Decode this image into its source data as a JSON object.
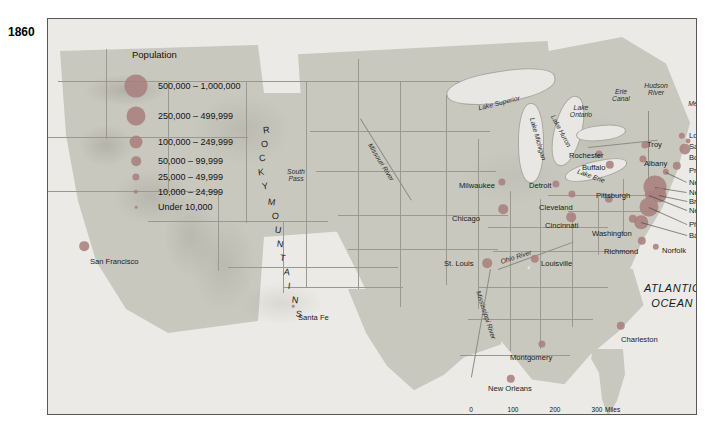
{
  "map": {
    "year": "1860",
    "ocean_label": "ATLANTIC\nOCEAN",
    "ocean_label_line1": "ATLANTIC",
    "ocean_label_line2": "OCEAN",
    "mountains_label": "ROCKY MOUNTAINS",
    "dot_color": "#a87f7e",
    "land_color": "#c9c8bf",
    "water_color": "#ebeae6",
    "border_color": "#9a988f"
  },
  "legend": {
    "title": "Population",
    "classes": [
      {
        "label": "500,000 – 1,000,000",
        "radius": 11.5
      },
      {
        "label": "250,000 – 499,999",
        "radius": 9.5
      },
      {
        "label": "100,000 – 249,999",
        "radius": 6.5
      },
      {
        "label": "50,000 – 99,999",
        "radius": 4.8
      },
      {
        "label": "25,000 – 49,999",
        "radius": 3.6
      },
      {
        "label": "10,000 – 24,999",
        "radius": 2.2
      },
      {
        "label": "Under 10,000",
        "radius": 1.3
      }
    ]
  },
  "cities": [
    {
      "name": "San Francisco",
      "x": 36,
      "y": 227,
      "r": 4.8,
      "lx": 42,
      "ly": 239,
      "anchor": "start"
    },
    {
      "name": "Santa Fe",
      "x": 245,
      "y": 287,
      "r": 1.3,
      "lx": 250,
      "ly": 295,
      "anchor": "start"
    },
    {
      "name": "Milwaukee",
      "x": 454,
      "y": 163,
      "r": 3.6,
      "lx": 411,
      "ly": 163,
      "anchor": "start"
    },
    {
      "name": "Chicago",
      "x": 455,
      "y": 190,
      "r": 4.8,
      "lx": 404,
      "ly": 196,
      "anchor": "start"
    },
    {
      "name": "St. Louis",
      "x": 439,
      "y": 244,
      "r": 4.8,
      "lx": 396,
      "ly": 241,
      "anchor": "start"
    },
    {
      "name": "Detroit",
      "x": 508,
      "y": 165,
      "r": 3.6,
      "lx": 481,
      "ly": 163,
      "anchor": "start"
    },
    {
      "name": "Cleveland",
      "x": 524,
      "y": 175,
      "r": 3.6,
      "lx": 491,
      "ly": 185,
      "anchor": "start"
    },
    {
      "name": "Cincinnati",
      "x": 523,
      "y": 198,
      "r": 4.8,
      "lx": 497,
      "ly": 203,
      "anchor": "start"
    },
    {
      "name": "Louisville",
      "x": 487,
      "y": 240,
      "r": 4.2,
      "lx": 493,
      "ly": 241,
      "anchor": "start"
    },
    {
      "name": "Pittsburgh",
      "x": 561,
      "y": 180,
      "r": 4.2,
      "lx": 548,
      "ly": 173,
      "anchor": "start"
    },
    {
      "name": "Buffalo",
      "x": 562,
      "y": 146,
      "r": 4.2,
      "lx": 534,
      "ly": 145,
      "anchor": "start"
    },
    {
      "name": "Rochester",
      "x": 551,
      "y": 135,
      "r": 3.6,
      "lx": 521,
      "ly": 133,
      "anchor": "start"
    },
    {
      "name": "Troy",
      "x": 597,
      "y": 126,
      "r": 3.6,
      "lx": 599,
      "ly": 122,
      "anchor": "start"
    },
    {
      "name": "Albany",
      "x": 595,
      "y": 140,
      "r": 3.6,
      "lx": 596,
      "ly": 141,
      "anchor": "start"
    },
    {
      "name": "Lowell",
      "x": 634,
      "y": 117,
      "r": 3.2,
      "lx": 641,
      "ly": 113,
      "anchor": "start"
    },
    {
      "name": "Salem",
      "x": 640,
      "y": 122,
      "r": 2.6,
      "lx": 641,
      "ly": 124,
      "anchor": "start"
    },
    {
      "name": "Boston",
      "x": 637,
      "y": 130,
      "r": 5.6,
      "lx": 641,
      "ly": 135,
      "anchor": "start"
    },
    {
      "name": "Providence",
      "x": 629,
      "y": 147,
      "r": 4.2,
      "lx": 641,
      "ly": 148,
      "anchor": "start"
    },
    {
      "name": "New Haven",
      "x": 618,
      "y": 153,
      "r": 3.2,
      "lx": 641,
      "ly": 160,
      "anchor": "start"
    },
    {
      "name": "New York",
      "x": 607,
      "y": 168,
      "r": 11.5,
      "lx": 641,
      "ly": 170,
      "anchor": "start"
    },
    {
      "name": "Brooklyn",
      "x": 611,
      "y": 176,
      "r": 7.5,
      "lx": 641,
      "ly": 179,
      "anchor": "start"
    },
    {
      "name": "Newark",
      "x": 601,
      "y": 176,
      "r": 4.2,
      "lx": 641,
      "ly": 188,
      "anchor": "start"
    },
    {
      "name": "Philadelphia",
      "x": 601,
      "y": 188,
      "r": 9.5,
      "lx": 641,
      "ly": 202,
      "anchor": "start"
    },
    {
      "name": "Baltimore",
      "x": 593,
      "y": 203,
      "r": 6.8,
      "lx": 641,
      "ly": 213,
      "anchor": "start"
    },
    {
      "name": "Washington",
      "x": 585,
      "y": 200,
      "r": 4.2,
      "lx": 544,
      "ly": 211,
      "anchor": "start"
    },
    {
      "name": "Richmond",
      "x": 594,
      "y": 222,
      "r": 4.2,
      "lx": 556,
      "ly": 229,
      "anchor": "start"
    },
    {
      "name": "Norfolk",
      "x": 608,
      "y": 228,
      "r": 3.2,
      "lx": 614,
      "ly": 228,
      "anchor": "start"
    },
    {
      "name": "Charleston",
      "x": 573,
      "y": 307,
      "r": 4.2,
      "lx": 573,
      "ly": 317,
      "anchor": "start"
    },
    {
      "name": "Montgomery",
      "x": 494,
      "y": 325,
      "r": 3.6,
      "lx": 462,
      "ly": 335,
      "anchor": "start"
    },
    {
      "name": "New Orleans",
      "x": 463,
      "y": 360,
      "r": 4.2,
      "lx": 440,
      "ly": 366,
      "anchor": "start"
    }
  ],
  "water_labels": [
    {
      "name": "Lake Superior",
      "x": 451,
      "y": 84,
      "rot": -14
    },
    {
      "name": "Lake Michigan",
      "x": 490,
      "y": 120,
      "rot": 74
    },
    {
      "name": "Lake Huron",
      "x": 513,
      "y": 112,
      "rot": 62
    },
    {
      "name": "Lake Erie",
      "x": 543,
      "y": 157,
      "rot": 20
    },
    {
      "name": "Lake Ontario",
      "x": 533,
      "y": 92,
      "rot": 0
    },
    {
      "name": "Erie Canal",
      "x": 573,
      "y": 76,
      "rot": 0
    },
    {
      "name": "Hudson River",
      "x": 608,
      "y": 70,
      "rot": 0
    },
    {
      "name": "Merrimack River",
      "x": 656,
      "y": 88,
      "rot": 0
    },
    {
      "name": "Missouri River",
      "x": 333,
      "y": 143,
      "rot": 58
    },
    {
      "name": "Mississippi River",
      "x": 438,
      "y": 296,
      "rot": 72
    },
    {
      "name": "Ohio River",
      "x": 468,
      "y": 238,
      "rot": -18
    },
    {
      "name": "South Pass",
      "x": 248,
      "y": 156,
      "rot": 0
    }
  ],
  "scale": {
    "miles_label": "Miles",
    "kilometers_label": "Kilometers",
    "miles_ticks": [
      "0",
      "100",
      "200",
      "300"
    ],
    "km_ticks": [
      "0",
      "100",
      "200",
      "300"
    ]
  }
}
